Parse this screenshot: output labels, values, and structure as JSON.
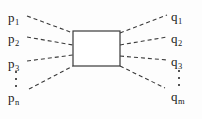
{
  "figure": {
    "type": "feynman-blob-diagram",
    "background_color": "#fdfdfd",
    "line_color": "#3a3a3a",
    "text_color": "#1a1a1a",
    "blob": {
      "shape": "rectangle",
      "x": 73,
      "y": 31,
      "width": 47,
      "height": 35
    },
    "incoming": {
      "side": "left",
      "labels": [
        {
          "base": "p",
          "sub": "1",
          "x": 8,
          "y": 11
        },
        {
          "base": "p",
          "sub": "2",
          "x": 8,
          "y": 32
        },
        {
          "base": "p",
          "sub": "3",
          "x": 8,
          "y": 57
        },
        {
          "base": "p",
          "sub": "n",
          "x": 8,
          "y": 91
        }
      ],
      "ellipsis": {
        "x": 14,
        "y": 71,
        "dots": 3
      }
    },
    "outgoing": {
      "side": "right",
      "labels": [
        {
          "base": "q",
          "sub": "1",
          "x": 171,
          "y": 10
        },
        {
          "base": "q",
          "sub": "2",
          "x": 171,
          "y": 32
        },
        {
          "base": "q",
          "sub": "3",
          "x": 171,
          "y": 55
        },
        {
          "base": "q",
          "sub": "m",
          "x": 171,
          "y": 90
        }
      ],
      "ellipsis": {
        "x": 177,
        "y": 70,
        "dots": 3
      }
    },
    "legs": [
      {
        "name": "leg-p1",
        "x1": 27,
        "y1": 16,
        "x2": 73,
        "y2": 33
      },
      {
        "name": "leg-p2",
        "x1": 27,
        "y1": 37,
        "x2": 73,
        "y2": 45
      },
      {
        "name": "leg-p3",
        "x1": 27,
        "y1": 61,
        "x2": 73,
        "y2": 55
      },
      {
        "name": "leg-pn",
        "x1": 29,
        "y1": 89,
        "x2": 73,
        "y2": 66
      },
      {
        "name": "leg-q1",
        "x1": 120,
        "y1": 33,
        "x2": 167,
        "y2": 15
      },
      {
        "name": "leg-q2",
        "x1": 120,
        "y1": 45,
        "x2": 167,
        "y2": 37
      },
      {
        "name": "leg-q3",
        "x1": 120,
        "y1": 56,
        "x2": 167,
        "y2": 60
      },
      {
        "name": "leg-qm",
        "x1": 120,
        "y1": 66,
        "x2": 165,
        "y2": 88
      }
    ]
  }
}
